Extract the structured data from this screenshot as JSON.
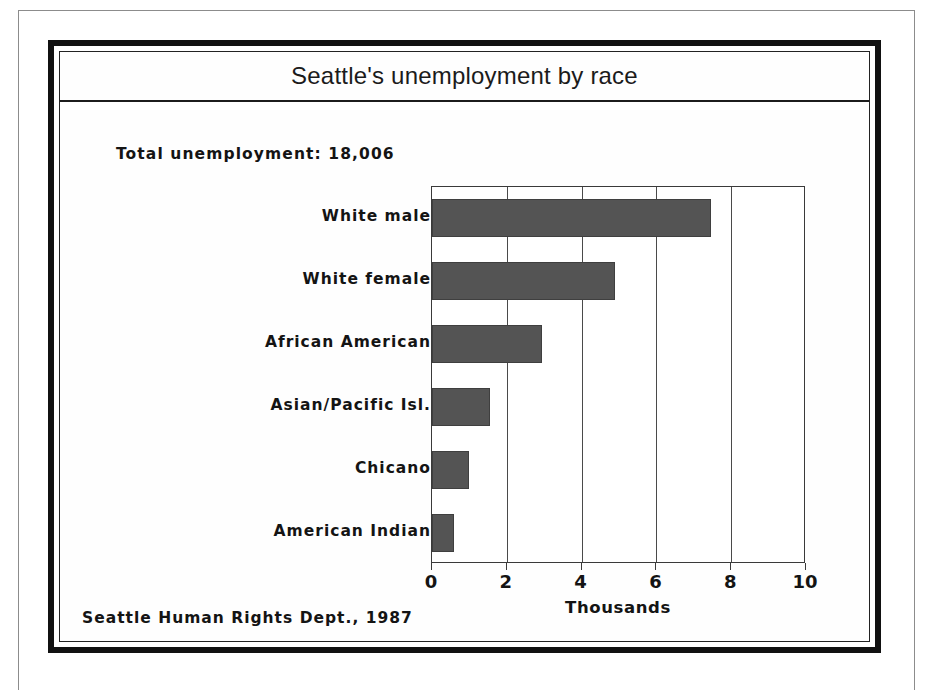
{
  "page": {
    "background_color": "#ffffff",
    "frame_color": "#111111"
  },
  "figure": {
    "title": "Seattle's unemployment by race",
    "total_annotation": "Total unemployment: 18,006",
    "source_caption": "Seattle Human Rights Dept., 1987"
  },
  "chart_data": {
    "type": "bar",
    "orientation": "horizontal",
    "title": "Seattle's unemployment by race",
    "xlabel": "Thousands",
    "ylabel": "",
    "xlim": [
      0,
      10
    ],
    "xticks": [
      0,
      2,
      4,
      6,
      8,
      10
    ],
    "xtick_labels": [
      "0",
      "2",
      "4",
      "6",
      "8",
      "10"
    ],
    "grid": "vertical-only",
    "legend": "none",
    "bar_color": "#545454",
    "categories": [
      "White male",
      "White female",
      "African American",
      "Asian/Pacific Isl.",
      "Chicano",
      "American Indian"
    ],
    "values": [
      7.45,
      4.9,
      2.95,
      1.55,
      1.0,
      0.6
    ],
    "value_units": "thousands of persons",
    "annotations": [
      "Total unemployment: 18,006",
      "Seattle Human Rights Dept., 1987"
    ]
  }
}
